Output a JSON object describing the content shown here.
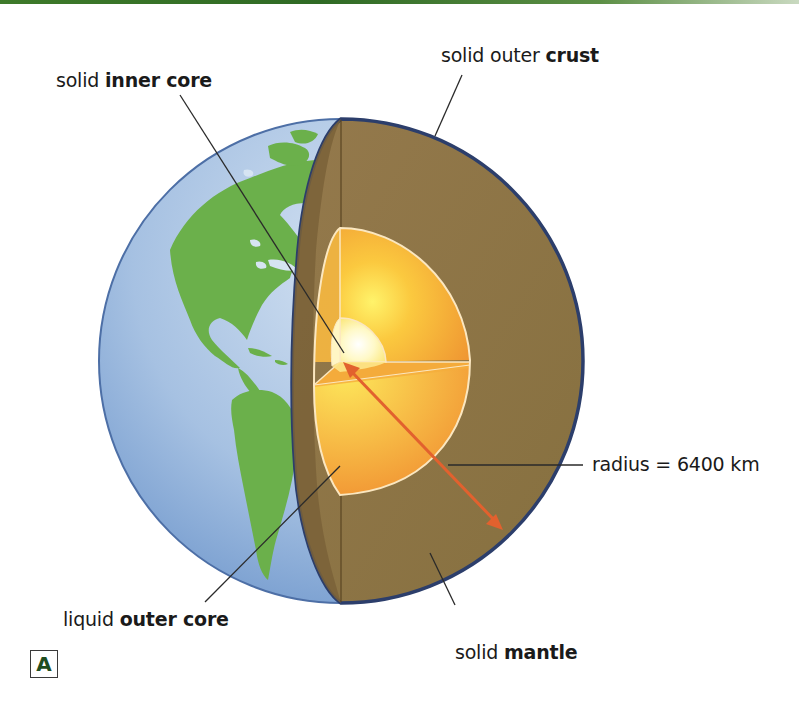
{
  "figure": {
    "panel_label": "A",
    "accent_color": "#3e7a2a"
  },
  "labels": {
    "inner_core": {
      "prefix": "solid",
      "bold": "inner core"
    },
    "crust": {
      "prefix": "solid outer",
      "bold": "crust"
    },
    "radius": {
      "text": "radius = 6400 km"
    },
    "outer_core": {
      "prefix": "liquid",
      "bold": "outer core"
    },
    "mantle": {
      "prefix": "solid",
      "bold": "mantle"
    }
  },
  "colors": {
    "ocean": "#a9c4e4",
    "land": "#6bb04b",
    "mantle": "#8b7248",
    "crust_edge": "#2c3e6b",
    "outer_core": "#f3a63b",
    "inner_core": "#fffbe0",
    "arrow": "#e2612e"
  }
}
